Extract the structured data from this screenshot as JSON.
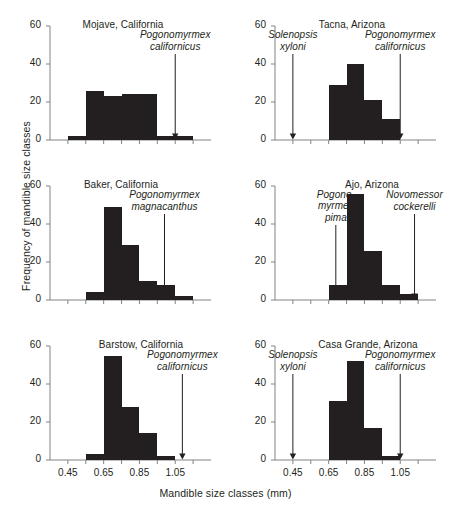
{
  "figure": {
    "ylabel": "Frequency of mandible size classes",
    "xlabel": "Mandible size classes (mm)",
    "bar_color": "#231f20",
    "axis_color": "#808285"
  },
  "chart_data": {
    "type": "bar",
    "title": "",
    "xlabel": "Mandible size classes (mm)",
    "ylabel": "Frequency of mandible size classes",
    "ylim": [
      0,
      60
    ],
    "yticks": [
      0,
      20,
      40,
      60
    ],
    "xlim": [
      0.35,
      1.25
    ],
    "xticks": [
      0.45,
      0.55,
      0.65,
      0.75,
      0.85,
      0.95,
      1.05,
      1.15
    ],
    "xticklabels": [
      "0.45",
      "0.65",
      "0.85",
      "1.05"
    ],
    "xticklabel_values": [
      0.45,
      0.65,
      0.85,
      1.05
    ],
    "grid": false,
    "legend": false,
    "bin_width": 0.1,
    "panels": [
      {
        "id": "mojave",
        "title": "Mojave, California",
        "bin_starts": [
          0.45,
          0.55,
          0.65,
          0.75,
          0.85,
          0.95,
          1.05
        ],
        "values": [
          2,
          26,
          23,
          24,
          24,
          2,
          2
        ],
        "annotations": [
          {
            "name": "pogonomyrmex-californicus",
            "lines": [
              "Pogonomyrmex",
              "californicus"
            ],
            "x": 1.05
          }
        ]
      },
      {
        "id": "tacna",
        "title": "Tacna, Arizona",
        "bin_starts": [
          0.65,
          0.75,
          0.85,
          0.95
        ],
        "values": [
          29,
          40,
          21,
          11
        ],
        "annotations": [
          {
            "name": "solenopsis-xyloni",
            "lines": [
              "Solenopsis",
              "xyloni"
            ],
            "x": 0.45
          },
          {
            "name": "pogonomyrmex-californicus",
            "lines": [
              "Pogonomyrmex",
              "californicus"
            ],
            "x": 1.05
          }
        ]
      },
      {
        "id": "baker",
        "title": "Baker, California",
        "bin_starts": [
          0.55,
          0.65,
          0.75,
          0.85,
          0.95,
          1.05
        ],
        "values": [
          4,
          49,
          29,
          10,
          8,
          2
        ],
        "annotations": [
          {
            "name": "pogonomyrmex-magnacanthus",
            "lines": [
              "Pogonomyrmex",
              "magnacanthus"
            ],
            "x": 0.99
          }
        ]
      },
      {
        "id": "ajo",
        "title": "Ajo, Arizona",
        "bin_starts": [
          0.65,
          0.75,
          0.85,
          0.95,
          1.05
        ],
        "values": [
          8,
          56,
          26,
          8,
          3
        ],
        "annotations": [
          {
            "name": "pogonomyrmex-pima",
            "lines": [
              "Pogono-",
              "myrmex",
              "pima"
            ],
            "x": 0.69
          },
          {
            "name": "novomessor-cockerelli",
            "lines": [
              "Novomessor",
              "cockerelli"
            ],
            "x": 1.13
          }
        ]
      },
      {
        "id": "barstow",
        "title": "Barstow, California",
        "bin_starts": [
          0.55,
          0.65,
          0.75,
          0.85,
          0.95
        ],
        "values": [
          3,
          55,
          28,
          14,
          2
        ],
        "annotations": [
          {
            "name": "pogonomyrmex-californicus",
            "lines": [
              "Pogonomyrmex",
              "californicus"
            ],
            "x": 1.09
          }
        ]
      },
      {
        "id": "casa-grande",
        "title": "Casa Grande, Arizona",
        "bin_starts": [
          0.65,
          0.75,
          0.85,
          0.95
        ],
        "values": [
          31,
          52,
          17,
          2
        ],
        "annotations": [
          {
            "name": "solenopsis-xyloni",
            "lines": [
              "Solenopsis",
              "xyloni"
            ],
            "x": 0.45
          },
          {
            "name": "pogonomyrmex-californicus",
            "lines": [
              "Pogonomyrmex",
              "californicus"
            ],
            "x": 1.05
          }
        ]
      }
    ]
  }
}
